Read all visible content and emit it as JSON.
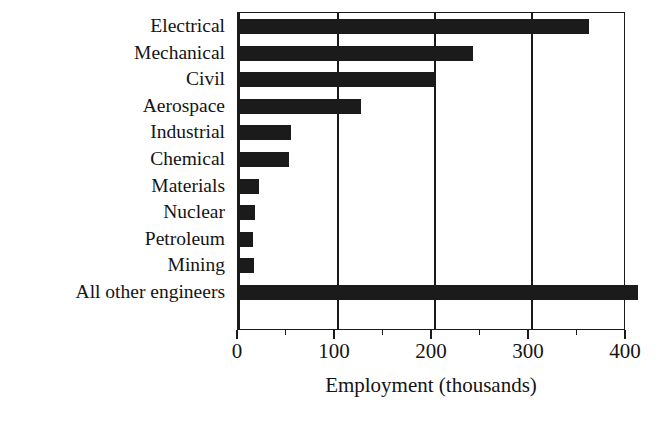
{
  "chart_data": {
    "type": "bar",
    "orientation": "horizontal",
    "title": "",
    "xlabel": "Employment (thousands)",
    "ylabel": "",
    "xlim": [
      0,
      400
    ],
    "xticks": [
      0,
      100,
      200,
      300,
      400
    ],
    "xtick_labels": [
      "0",
      "100",
      "200",
      "300",
      "400"
    ],
    "minor_xticks": [
      50,
      150,
      250,
      350
    ],
    "grid": "vertical-major",
    "legend": "none",
    "bar_color": "#1b1b1b",
    "categories": [
      "Electrical",
      "Mechanical",
      "Civil",
      "Aerospace",
      "Industrial",
      "Chemical",
      "Materials",
      "Nuclear",
      "Petroleum",
      "Mining",
      "All other engineers"
    ],
    "values": [
      360,
      240,
      200,
      125,
      53,
      50,
      20,
      15,
      13,
      14,
      410
    ]
  },
  "axis": {
    "x_title": "Employment (thousands)"
  }
}
